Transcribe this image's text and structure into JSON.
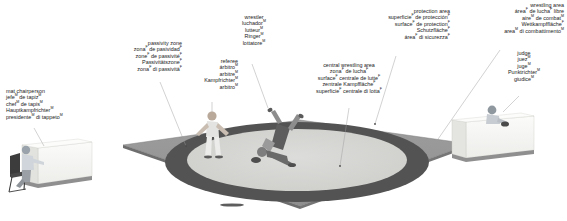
{
  "diagram": {
    "colors": {
      "protection_area": "#9a9a9a",
      "passivity_zone": "#535353",
      "central_area": "#d4d4d2",
      "mat_edge": "#6e6e6e",
      "furniture": "#f2f2f0",
      "leader_line": "#8c8c8c",
      "text": "#1a1a1a"
    },
    "labels": [
      {
        "id": "passivity-zone",
        "align": "right",
        "lines": [
          {
            "text": "passivity zone",
            "sup": ""
          },
          {
            "text": "zona",
            "sup": "F",
            "tail": " de pasividad",
            "tail_sup": "F"
          },
          {
            "text": "zone",
            "sup": "F",
            "tail": " de passivité",
            "tail_sup": "F"
          },
          {
            "text": "Passivitätszone",
            "sup": "F"
          },
          {
            "text": "zona",
            "sup": "F",
            "tail": " di passività",
            "tail_sup": "F"
          }
        ]
      },
      {
        "id": "mat-chairperson",
        "align": "left",
        "lines": [
          {
            "text": "mat chairperson",
            "sup": ""
          },
          {
            "text": "jefe",
            "sup": "M",
            "tail": " de tapiz",
            "tail_sup": "M"
          },
          {
            "text": "chef",
            "sup": "M",
            "tail": " de tapis",
            "tail_sup": "M"
          },
          {
            "text": "Hauptkampfrichter",
            "sup": "M"
          },
          {
            "text": "presidente",
            "sup": "M",
            "tail": " di tappeto",
            "tail_sup": "M"
          }
        ]
      },
      {
        "id": "referee",
        "align": "right",
        "lines": [
          {
            "text": "referee",
            "sup": ""
          },
          {
            "text": "árbitro",
            "sup": "M"
          },
          {
            "text": "arbitre",
            "sup": "M"
          },
          {
            "text": "Kampfrichter",
            "sup": "M"
          },
          {
            "text": "arbitro",
            "sup": "M"
          }
        ]
      },
      {
        "id": "wrestler",
        "align": "center",
        "lines": [
          {
            "text": "wrestler",
            "sup": ""
          },
          {
            "text": "luchador",
            "sup": "M"
          },
          {
            "text": "lutteur",
            "sup": "M"
          },
          {
            "text": "Ringer",
            "sup": "M"
          },
          {
            "text": "lottatore",
            "sup": "M"
          }
        ]
      },
      {
        "id": "central-wrestling-area",
        "align": "center",
        "lines": [
          {
            "text": "central wrestling area",
            "sup": ""
          },
          {
            "text": "zona",
            "sup": "F",
            "tail": " de lucha",
            "tail_sup": "F"
          },
          {
            "text": "surface",
            "sup": "F",
            "tail": " centrale de lutte",
            "tail_sup": "F"
          },
          {
            "text": "zentrale Kampffläche",
            "sup": "F"
          },
          {
            "text": "superficie",
            "sup": "F",
            "tail": " centrale di lotta",
            "tail_sup": "F"
          }
        ]
      },
      {
        "id": "protection-area",
        "align": "right",
        "lines": [
          {
            "text": "protection area",
            "sup": ""
          },
          {
            "text": "superficie",
            "sup": "F",
            "tail": " de protección",
            "tail_sup": "F"
          },
          {
            "text": "surface",
            "sup": "F",
            "tail": " de protection",
            "tail_sup": "F"
          },
          {
            "text": "Schutzfläche",
            "sup": "F"
          },
          {
            "text": "área",
            "sup": "F",
            "tail": " di sicurezza",
            "tail_sup": "F"
          }
        ]
      },
      {
        "id": "wrestling-area",
        "align": "right",
        "lines": [
          {
            "text": "wrestling area",
            "sup": ""
          },
          {
            "text": "área",
            "sup": "F",
            "tail": " de lucha",
            "tail_sup": "F",
            "tail2": " libre"
          },
          {
            "text": "aire",
            "sup": "M",
            "tail": " de combat",
            "tail_sup": "M"
          },
          {
            "text": "Wettkampffläche",
            "sup": "F"
          },
          {
            "text": "area",
            "sup": "M",
            "tail": " di combattimento",
            "tail_sup": "M"
          }
        ]
      },
      {
        "id": "judge",
        "align": "center",
        "lines": [
          {
            "text": "judge",
            "sup": ""
          },
          {
            "text": "juez",
            "sup": "M"
          },
          {
            "text": "juge",
            "sup": "M"
          },
          {
            "text": "Punktrichter",
            "sup": "M"
          },
          {
            "text": "giudice",
            "sup": "M"
          }
        ]
      }
    ]
  }
}
